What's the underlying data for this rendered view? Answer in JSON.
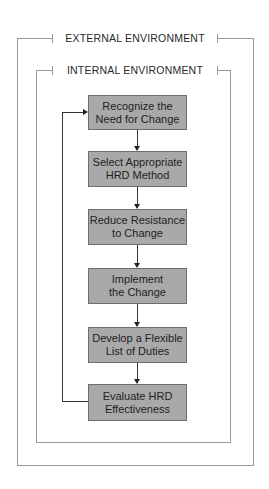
{
  "diagram": {
    "outer_frame": {
      "label": "EXTERNAL ENVIRONMENT"
    },
    "inner_frame": {
      "label": "INTERNAL ENVIRONMENT"
    },
    "steps": [
      {
        "line1": "Recognize the",
        "line2": "Need for Change"
      },
      {
        "line1": "Select Appropriate",
        "line2": "HRD Method"
      },
      {
        "line1": "Reduce Resistance",
        "line2": "to Change"
      },
      {
        "line1": "Implement",
        "line2": "the Change"
      },
      {
        "line1": "Develop a Flexible",
        "line2": "List of Duties"
      },
      {
        "line1": "Evaluate HRD",
        "line2": "Effectiveness"
      }
    ],
    "feedback_loop": {
      "from": "Evaluate HRD Effectiveness",
      "to": "Recognize the Need for Change"
    },
    "colors": {
      "box_fill": "#a9a9a9",
      "frame_line": "#9a9a9a",
      "text": "#222222"
    }
  }
}
